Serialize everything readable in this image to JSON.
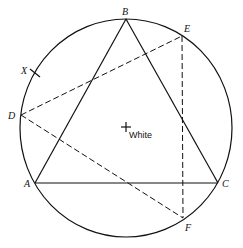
{
  "diagram": {
    "type": "geometry-construction",
    "circle": {
      "cx": 126,
      "cy": 128,
      "rx": 106,
      "ry": 109
    },
    "points": {
      "A": {
        "label": "A",
        "x": 35,
        "y": 183,
        "lx": 24,
        "ly": 187
      },
      "B": {
        "label": "B",
        "x": 126,
        "y": 19,
        "lx": 122,
        "ly": 14
      },
      "C": {
        "label": "C",
        "x": 218,
        "y": 183,
        "lx": 222,
        "ly": 187
      },
      "D": {
        "label": "D",
        "x": 21,
        "y": 115,
        "lx": 9,
        "ly": 119
      },
      "E": {
        "label": "E",
        "x": 182,
        "y": 36,
        "lx": 184,
        "ly": 32
      },
      "F": {
        "label": "F",
        "x": 183,
        "y": 218,
        "lx": 185,
        "ly": 230
      },
      "X": {
        "label": "X",
        "x": 35,
        "y": 73,
        "lx": 22,
        "ly": 73
      }
    },
    "white_point": {
      "label": "White",
      "x": 126,
      "y": 127
    },
    "solid_segments": [
      [
        "A",
        "B"
      ],
      [
        "B",
        "C"
      ],
      [
        "C",
        "A"
      ]
    ],
    "dashed_segments": [
      [
        "D",
        "E"
      ],
      [
        "D",
        "F"
      ],
      [
        "E",
        "F"
      ]
    ]
  }
}
